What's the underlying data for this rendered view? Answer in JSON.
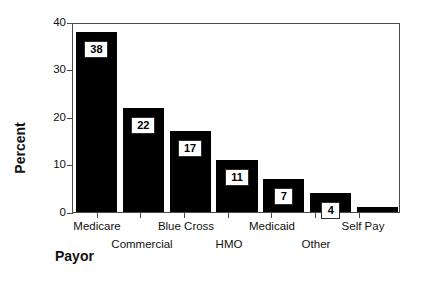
{
  "chart_data": {
    "type": "bar",
    "title": "",
    "xlabel": "Payor",
    "ylabel": "Percent",
    "categories": [
      "Medicare",
      "Commercial",
      "Blue Cross",
      "HMO",
      "Medicaid",
      "Other",
      "Self Pay"
    ],
    "values": [
      38,
      22,
      17,
      11,
      7,
      4,
      1
    ],
    "data_labels": [
      "38",
      "22",
      "17",
      "11",
      "7",
      "4",
      ""
    ],
    "ylim": [
      0,
      40
    ],
    "yticks": [
      0,
      10,
      20,
      30,
      40
    ],
    "ytick_labels": [
      "0",
      "10",
      "20",
      "30",
      "40"
    ],
    "grid": false,
    "legend": "none",
    "bar_color": "#000000",
    "label_box_fill": "#ffffff",
    "label_box_border": "#2c2c2c",
    "axis_color": "#4a4a4a",
    "background": "#ffffff",
    "label_rows": [
      0,
      1,
      0,
      1,
      0,
      1,
      0
    ]
  }
}
